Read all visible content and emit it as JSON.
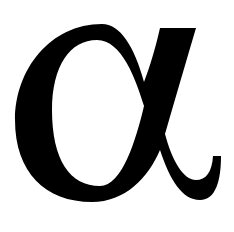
{
  "glyph": {
    "character": "α",
    "name": "Greek small letter alpha",
    "color": "#000000",
    "background": "#ffffff"
  }
}
